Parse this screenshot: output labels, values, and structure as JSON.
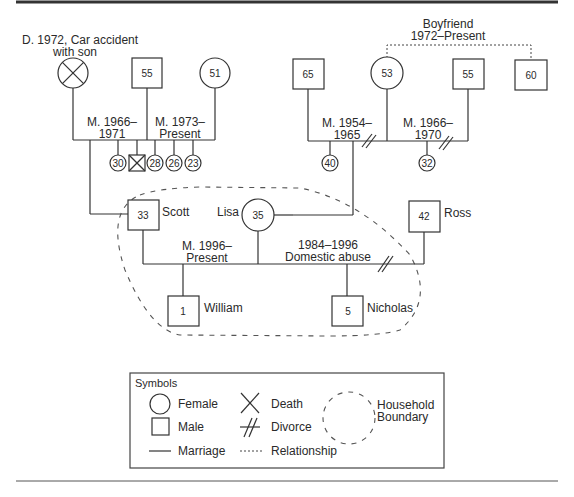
{
  "title_rule": {
    "color": "#333333"
  },
  "left_family": {
    "death_note_line1": "D. 1972, Car accident",
    "death_note_line2": "with son",
    "father_age": "55",
    "second_wife_age": "51",
    "first_marriage_line1": "M. 1966–",
    "first_marriage_line2": "1971",
    "second_marriage_line1": "M. 1973–",
    "second_marriage_line2": "Present",
    "children": [
      "30",
      "",
      "28",
      "26",
      "23"
    ]
  },
  "right_family": {
    "boyfriend_line1": "Boyfriend",
    "boyfriend_line2": "1972–Present",
    "first_husband_age": "65",
    "mother_age": "53",
    "second_husband_age": "55",
    "boyfriend_age": "60",
    "first_marriage_line1": "M. 1954–",
    "first_marriage_line2": "1965",
    "second_marriage_line1": "M. 1966–",
    "second_marriage_line2": "1970",
    "children": [
      "40",
      "32"
    ]
  },
  "household": {
    "scott": {
      "name": "Scott",
      "age": "33"
    },
    "lisa": {
      "name": "Lisa",
      "age": "35"
    },
    "ross": {
      "name": "Ross",
      "age": "42"
    },
    "william": {
      "name": "William",
      "age": "1"
    },
    "nicholas": {
      "name": "Nicholas",
      "age": "5"
    },
    "marriage_line1": "M. 1996–",
    "marriage_line2": "Present",
    "prior_line1": "1984–1996",
    "prior_line2": "Domestic abuse"
  },
  "legend": {
    "title": "Symbols",
    "female": "Female",
    "male": "Male",
    "marriage": "Marriage",
    "death": "Death",
    "divorce": "Divorce",
    "relationship": "Relationship",
    "household_line1": "Household",
    "household_line2": "Boundary"
  }
}
